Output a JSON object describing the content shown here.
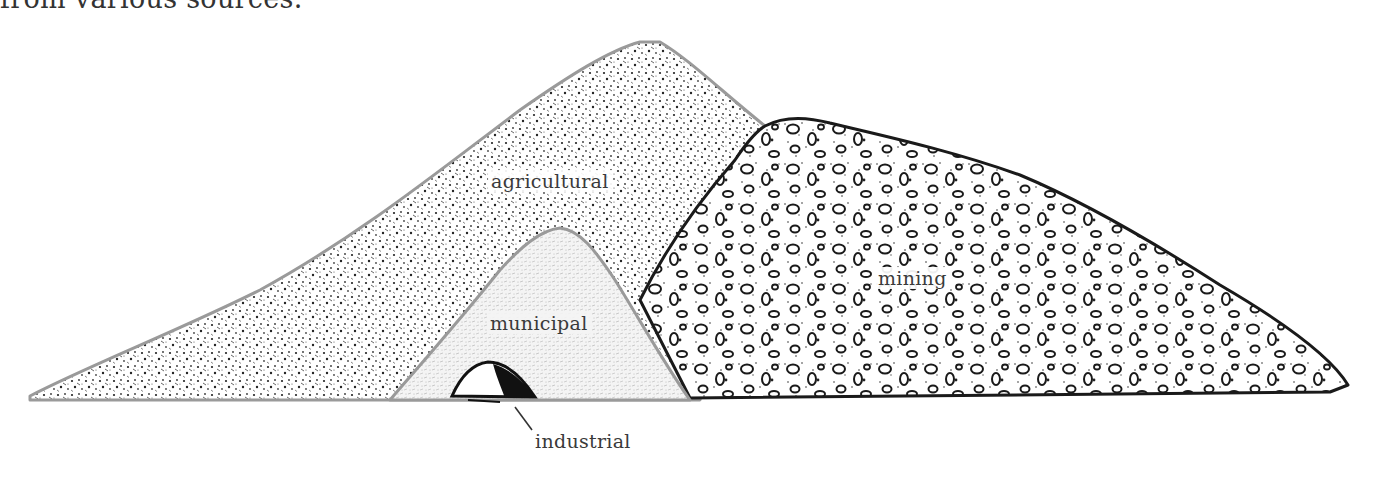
{
  "caption_fragment": "from various sources.",
  "diagram": {
    "type": "waste-pile comparison illustration",
    "piles": [
      {
        "id": "agricultural",
        "label": "agricultural",
        "texture": "fine speckle",
        "outline_color": "#9a9a9a"
      },
      {
        "id": "mining",
        "label": "mining",
        "texture": "pebbles and dots",
        "outline_color": "#1a1a1a"
      },
      {
        "id": "municipal",
        "label": "municipal",
        "texture": "light grey stipple",
        "outline_color": "#9a9a9a"
      },
      {
        "id": "industrial",
        "label": "industrial",
        "texture": "dark black mound",
        "outline_color": "#111111"
      }
    ]
  },
  "labels": {
    "agricultural": "agricultural",
    "municipal": "municipal",
    "mining": "mining",
    "industrial": "industrial"
  },
  "colors": {
    "ink": "#1a1a1a",
    "grey_outline": "#9a9a9a",
    "label_text": "#3a3a3a",
    "background": "#ffffff"
  }
}
